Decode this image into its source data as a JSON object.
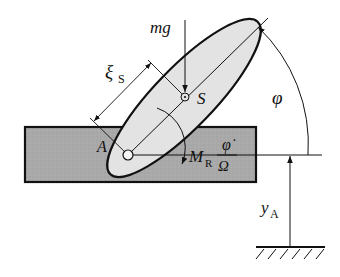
{
  "diagram": {
    "labels": {
      "mass_gravity": "mg",
      "center_of_mass": "S",
      "pivot_point": "A",
      "distance_symbol": "ξ",
      "distance_subscript": "S",
      "angle": "φ",
      "moment_symbol": "M",
      "moment_subscript": "R",
      "moment_numerator": "φ̇",
      "moment_denominator": "Ω",
      "displacement_symbol": "y",
      "displacement_subscript": "A"
    },
    "colors": {
      "base_fill": "#a9a9a9",
      "body_fill": "#e3e3e3",
      "stroke": "#111111",
      "background": "#ffffff"
    }
  }
}
